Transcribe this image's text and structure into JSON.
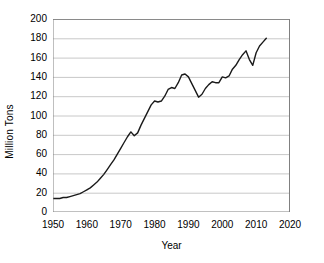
{
  "chart_data": {
    "type": "line",
    "title": "",
    "xlabel": "Year",
    "ylabel": "Million Tons",
    "xlim": [
      1950,
      2020
    ],
    "ylim": [
      0,
      200
    ],
    "xticks": [
      1950,
      1960,
      1970,
      1980,
      1990,
      2000,
      2010,
      2020
    ],
    "yticks": [
      0,
      20,
      40,
      60,
      80,
      100,
      120,
      140,
      160,
      180,
      200
    ],
    "grid": "horizontal",
    "legend": "none",
    "line_color": "#1a1a1a",
    "grid_color": "#c8c8c8",
    "axis_color": "#808080",
    "background_color": "#ffffff",
    "series": [
      {
        "name": "Million Tons",
        "x": [
          1950,
          1951,
          1952,
          1953,
          1954,
          1955,
          1956,
          1957,
          1958,
          1959,
          1960,
          1961,
          1962,
          1963,
          1964,
          1965,
          1966,
          1967,
          1968,
          1969,
          1970,
          1971,
          1972,
          1973,
          1974,
          1975,
          1976,
          1977,
          1978,
          1979,
          1980,
          1981,
          1982,
          1983,
          1984,
          1985,
          1986,
          1987,
          1988,
          1989,
          1990,
          1991,
          1992,
          1993,
          1994,
          1995,
          1996,
          1997,
          1998,
          1999,
          2000,
          2001,
          2002,
          2003,
          2004,
          2005,
          2006,
          2007,
          2008,
          2009,
          2010,
          2011,
          2012,
          2013
        ],
        "y": [
          14,
          14,
          14,
          15,
          15,
          16,
          17,
          18,
          19,
          21,
          23,
          25,
          28,
          31,
          35,
          39,
          44,
          49,
          54,
          60,
          66,
          72,
          78,
          83,
          79,
          82,
          90,
          97,
          104,
          111,
          115,
          114,
          115,
          120,
          127,
          129,
          128,
          134,
          142,
          143,
          140,
          133,
          126,
          119,
          122,
          128,
          132,
          135,
          134,
          134,
          140,
          139,
          141,
          148,
          152,
          158,
          163,
          167,
          158,
          152,
          165,
          172,
          176,
          180
        ]
      }
    ]
  },
  "axis": {
    "y_tick_labels": [
      "200",
      "180",
      "160",
      "140",
      "120",
      "100",
      "80",
      "60",
      "40",
      "20",
      "0"
    ],
    "x_tick_labels": [
      "1950",
      "1960",
      "1970",
      "1980",
      "1990",
      "2000",
      "2010",
      "2020"
    ],
    "y_title": "Million Tons",
    "x_title": "Year"
  }
}
